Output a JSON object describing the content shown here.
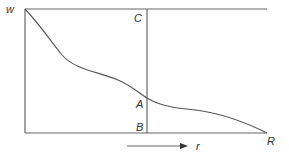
{
  "diagram": {
    "labels": {
      "w": "w",
      "C": "C",
      "A": "A",
      "B": "B",
      "R": "R",
      "r": "r"
    },
    "colors": {
      "line": "#666666",
      "curve": "#555555",
      "text": "#333333"
    }
  }
}
